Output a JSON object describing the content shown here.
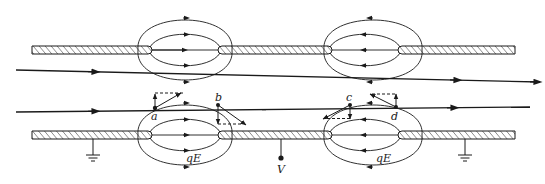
{
  "diagram": {
    "type": "electrostatic lens / accelerating gap diagram",
    "colors": {
      "ink": "#1a1a1a",
      "background": "#ffffff"
    },
    "electrodes": [
      {
        "name": "top-electrode",
        "y": 50,
        "segments": [
          [
            32,
            152
          ],
          [
            218,
            332
          ],
          [
            398,
            515
          ]
        ]
      },
      {
        "name": "bottom-electrode",
        "y": 135,
        "segments": [
          [
            32,
            152
          ],
          [
            218,
            332
          ],
          [
            398,
            515
          ]
        ]
      }
    ],
    "gaps": [
      {
        "name": "left-gap",
        "x1": 152,
        "x2": 218,
        "field_direction": "right"
      },
      {
        "name": "right-gap",
        "x1": 332,
        "x2": 398,
        "field_direction": "left"
      }
    ],
    "beams": [
      {
        "name": "upper-beam",
        "from": [
          16,
          70
        ],
        "to": [
          540,
          82
        ]
      },
      {
        "name": "lower-beam",
        "from": [
          16,
          112
        ],
        "to": [
          530,
          107
        ]
      }
    ],
    "points": [
      {
        "id": "a",
        "label": "a",
        "x": 154,
        "y": 108
      },
      {
        "id": "b",
        "label": "b",
        "x": 218,
        "y": 105
      },
      {
        "id": "c",
        "label": "c",
        "x": 350,
        "y": 105
      },
      {
        "id": "d",
        "label": "d",
        "x": 396,
        "y": 107
      }
    ],
    "labels": {
      "a": "a",
      "b": "b",
      "c": "c",
      "d": "d",
      "field_left": "qE",
      "field_right": "qE",
      "voltage": "V"
    },
    "grounds": [
      {
        "name": "left-ground",
        "x": 93
      },
      {
        "name": "right-ground",
        "x": 465
      }
    ],
    "voltage_terminal": {
      "x": 281,
      "label": "V"
    }
  }
}
